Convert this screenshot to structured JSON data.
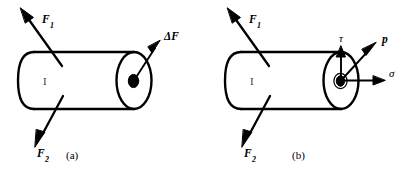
{
  "figure": {
    "background_color": "#ffffff",
    "stroke_color": "#000000",
    "panels": [
      {
        "id": "a",
        "caption": "(a)",
        "caption_x": 66,
        "caption_y": 150,
        "body_label": "I",
        "body_label_x": 43,
        "body_label_y": 76,
        "labels": [
          {
            "name": "force-f1",
            "text": "F",
            "sub": "1",
            "x": 42,
            "y": 14
          },
          {
            "name": "force-f2",
            "text": "F",
            "sub": "2",
            "x": 37,
            "y": 148
          },
          {
            "name": "delta-force",
            "text": "ΔF",
            "sub": "",
            "x": 164,
            "y": 31
          }
        ]
      },
      {
        "id": "b",
        "caption": "(b)",
        "caption_x": 292,
        "caption_y": 150,
        "body_label": "I",
        "body_label_x": 250,
        "body_label_y": 76,
        "labels": [
          {
            "name": "force-f1",
            "text": "F",
            "sub": "1",
            "x": 249,
            "y": 14
          },
          {
            "name": "force-f2",
            "text": "F",
            "sub": "2",
            "x": 244,
            "y": 148
          },
          {
            "name": "shear-stress-tau",
            "text": "τ",
            "sub": "",
            "x": 339,
            "y": 33
          },
          {
            "name": "traction-vector-p",
            "text": "p",
            "sub": "",
            "x": 382,
            "y": 34
          },
          {
            "name": "normal-stress-sigma",
            "text": "σ",
            "sub": "",
            "x": 389,
            "y": 68
          }
        ]
      }
    ]
  }
}
